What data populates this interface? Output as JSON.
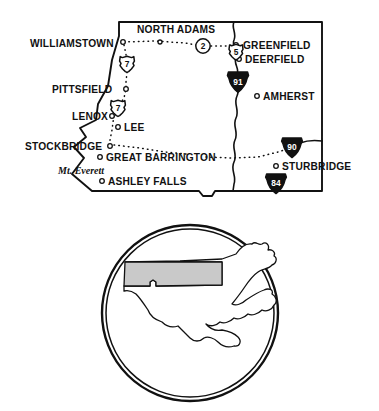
{
  "figure": {
    "region_name": "Western Massachusetts",
    "style": "hand-drawn line map"
  },
  "colors": {
    "ink": "#111111",
    "paper": "#ffffff",
    "region_shade": "#c9c9c9"
  },
  "main_map": {
    "towns": [
      {
        "name": "WILLIAMSTOWN",
        "x": 30,
        "y": 44,
        "dot_x": 123,
        "dot_y": 42,
        "anchor": "start",
        "size": "lg"
      },
      {
        "name": "NORTH ADAMS",
        "x": 137,
        "y": 33,
        "dot_x": 160,
        "dot_y": 42,
        "anchor": "start",
        "size": "lg"
      },
      {
        "name": "GREENFIELD",
        "x": 243,
        "y": 49,
        "dot_x": 236,
        "dot_y": 45,
        "anchor": "start",
        "size": "lg"
      },
      {
        "name": "DEERFIELD",
        "x": 245,
        "y": 63,
        "dot_x": 239,
        "dot_y": 59,
        "anchor": "start",
        "size": "lg"
      },
      {
        "name": "PITTSFIELD",
        "x": 52,
        "y": 92,
        "dot_x": 126,
        "dot_y": 89,
        "anchor": "start",
        "size": "lg"
      },
      {
        "name": "AMHERST",
        "x": 263,
        "y": 100,
        "dot_x": 257,
        "dot_y": 96,
        "anchor": "start",
        "size": "lg"
      },
      {
        "name": "LENOX",
        "x": 72,
        "y": 117,
        "dot_x": 112,
        "dot_y": 116,
        "anchor": "start",
        "size": "lg"
      },
      {
        "name": "LEE",
        "x": 124,
        "y": 130,
        "dot_x": 118,
        "dot_y": 127,
        "anchor": "start",
        "size": "lg"
      },
      {
        "name": "STOCKBRIDGE",
        "x": 25,
        "y": 148,
        "dot_x": 110,
        "dot_y": 146,
        "anchor": "start",
        "size": "lg"
      },
      {
        "name": "GREAT BARRINGTON",
        "x": 106,
        "y": 161,
        "dot_x": 100,
        "dot_y": 157,
        "anchor": "start",
        "size": "lg"
      },
      {
        "name": "STURBRIDGE",
        "x": 282,
        "y": 170,
        "dot_x": 276,
        "dot_y": 166,
        "anchor": "start",
        "size": "lg"
      },
      {
        "name": "ASHLEY FALLS",
        "x": 108,
        "y": 184,
        "dot_x": 102,
        "dot_y": 181,
        "anchor": "start",
        "size": "lg"
      }
    ],
    "landmarks": [
      {
        "name": "Mt. Everett",
        "x": 58,
        "y": 173,
        "anchor": "start"
      }
    ],
    "route_shields": [
      {
        "number": "2",
        "type": "us-circle",
        "x": 203,
        "y": 46
      },
      {
        "number": "7",
        "type": "us-shield",
        "x": 127,
        "y": 64
      },
      {
        "number": "5",
        "type": "us-shield",
        "x": 236,
        "y": 52
      },
      {
        "number": "91",
        "type": "interstate",
        "x": 238,
        "y": 82
      },
      {
        "number": "7",
        "type": "us-shield",
        "x": 118,
        "y": 108
      },
      {
        "number": "90",
        "type": "interstate",
        "x": 292,
        "y": 147
      },
      {
        "number": "84",
        "type": "interstate",
        "x": 276,
        "y": 183
      }
    ],
    "features": [
      {
        "name": "Connecticut River",
        "type": "river"
      },
      {
        "name": "State Border",
        "type": "border"
      },
      {
        "name": "Route 2 corridor",
        "type": "dotted-road"
      },
      {
        "name": "Route 7 corridor",
        "type": "dotted-road"
      },
      {
        "name": "Massachusetts Turnpike corridor",
        "type": "dotted-road"
      }
    ]
  },
  "inset_map": {
    "name": "Massachusetts state locator",
    "state": "Massachusetts",
    "highlighted_region": "Western Massachusetts / Berkshires",
    "shape": "circle"
  }
}
